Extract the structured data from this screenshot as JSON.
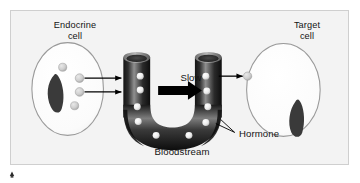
{
  "figure": {
    "type": "biology-diagram",
    "background_color": "#f3f3f3",
    "page_background": "#ffffff",
    "border_color": "#cfcfcf"
  },
  "labels": {
    "endocrine_cell": "Endocrine\ncell",
    "target_cell": "Target\ncell",
    "slow": "Slow",
    "bloodstream": "Bloodstream",
    "hormone": "Hormone"
  },
  "elements": {
    "endocrine_cell": {
      "name": "Endocrine cell",
      "shape": "oval",
      "membrane_color": "#9a9a9a",
      "fill_color": "#fbfbfb",
      "nucleus_color": "#3a3a3a",
      "nucleus_shape": "curved-kidney",
      "vesicle_count": 4,
      "vesicle_color": "#c9c9c9"
    },
    "blood_vessel": {
      "name": "Bloodstream",
      "shape": "U-shaped tube",
      "color_dark": "#1e1e1e",
      "color_mid": "#4d4d4d",
      "color_highlight": "#a8a8a8",
      "open_ends": 2,
      "hormone_dot_count": 10,
      "hormone_dot_color": "#efefef"
    },
    "target_cell": {
      "name": "Target cell",
      "shape": "oval",
      "membrane_color": "#9a9a9a",
      "fill_color": "#fdfdfd",
      "nucleus_color": "#3a3a3a",
      "nucleus_shape": "curved-kidney",
      "bound_hormone_count": 1
    },
    "secretion_arrows": {
      "name": "Secretion arrows",
      "count": 2,
      "direction": "right",
      "color": "#000000"
    },
    "flow_arrow": {
      "name": "Slow flow arrow",
      "direction": "right",
      "color": "#000000",
      "style": "thick-block"
    },
    "uptake_arrow": {
      "name": "Target uptake arrow",
      "direction": "right",
      "color": "#000000"
    },
    "hormone_leader": {
      "name": "Hormone leader line",
      "color": "#000000"
    },
    "corner_mark": {
      "name": "Corner mark",
      "color": "#2b2b2b"
    }
  }
}
